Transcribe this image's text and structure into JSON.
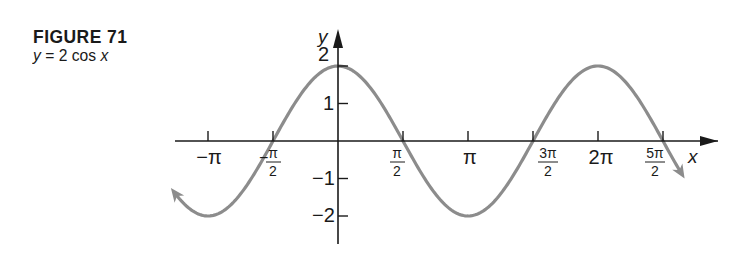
{
  "figure": {
    "label": "FIGURE 71",
    "caption_lhs": "y",
    "caption_eq": " = 2 cos ",
    "caption_var": "x"
  },
  "chart_data": {
    "type": "line",
    "title": "y = 2 cos x",
    "function": "2*cos(x)",
    "xlabel": "x",
    "ylabel": "y",
    "xlim": [
      -3.5,
      8.2
    ],
    "ylim": [
      -2.6,
      2.5
    ],
    "grid": false,
    "legend": null,
    "curve_color": "#8c8c8c",
    "axis_color": "#1a1a1a",
    "x_ticks": [
      {
        "value": -3.14159,
        "label": "−π"
      },
      {
        "value": -1.5708,
        "label": "−π/2"
      },
      {
        "value": 1.5708,
        "label": "π/2"
      },
      {
        "value": 3.14159,
        "label": "π"
      },
      {
        "value": 4.71239,
        "label": "3π/2"
      },
      {
        "value": 6.28319,
        "label": "2π"
      },
      {
        "value": 7.85398,
        "label": "5π/2"
      }
    ],
    "y_ticks": [
      {
        "value": 2,
        "label": "2"
      },
      {
        "value": 1,
        "label": "1"
      },
      {
        "value": -1,
        "label": "−1"
      },
      {
        "value": -2,
        "label": "−2"
      }
    ],
    "x": [
      -4.0,
      -3.14159,
      -1.5708,
      0,
      1.5708,
      3.14159,
      4.71239,
      6.28319,
      7.85398,
      8.3
    ],
    "y": [
      -1.31,
      -2,
      0,
      2,
      0,
      -2,
      0,
      2,
      0,
      -0.87
    ],
    "annotations": [
      "arrowheads at both ends of curve indicating continuation"
    ]
  },
  "axis_labels": {
    "x": "x",
    "y": "y",
    "neg_pi": "−π",
    "pi": "π",
    "two_pi": "2π",
    "neg_pi_half_sign": "−",
    "pi_num": "π",
    "three_pi_num": "3π",
    "five_pi_num": "5π",
    "den": "2",
    "y2": "2",
    "y1": "1",
    "ym1": "−1",
    "ym2": "−2"
  }
}
